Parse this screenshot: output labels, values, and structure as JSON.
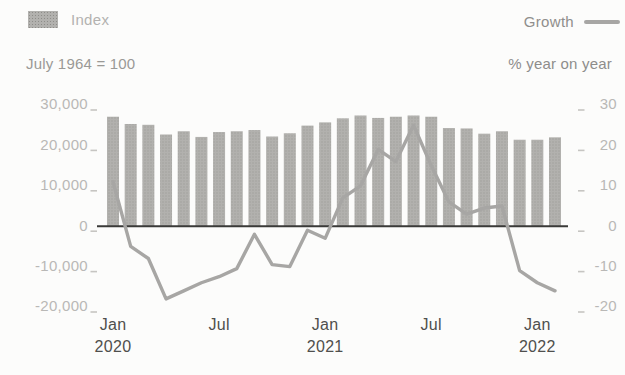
{
  "legend": {
    "index_label": "Index",
    "growth_label": "Growth"
  },
  "subtitles": {
    "left": "July 1964 = 100",
    "right": "% year on year"
  },
  "colors": {
    "page_bg": "#fcfcfb",
    "bar_base": "#b2b1ae",
    "bar_dot": "#8e8d89",
    "line": "#a7a6a4",
    "zero_axis": "#3a3a38",
    "tick_dash": "#c6c5c2",
    "ytick_text": "#b9b8b6",
    "xtick_text": "#4f4f4d",
    "legend_index_text": "#b3b2b0",
    "legend_growth_text": "#8f8e8c",
    "subtitle_left_text": "#9a9996",
    "subtitle_right_text": "#8e8d8b"
  },
  "chart_data": {
    "type": "combo",
    "subtypes": [
      "bar",
      "line"
    ],
    "categories": [
      "Jan 2020",
      "Feb 2020",
      "Mar 2020",
      "Apr 2020",
      "May 2020",
      "Jun 2020",
      "Jul 2020",
      "Aug 2020",
      "Sep 2020",
      "Oct 2020",
      "Nov 2020",
      "Dec 2020",
      "Jan 2021",
      "Feb 2021",
      "Mar 2021",
      "Apr 2021",
      "May 2021",
      "Jun 2021",
      "Jul 2021",
      "Aug 2021",
      "Sep 2021",
      "Oct 2021",
      "Nov 2021",
      "Dec 2021",
      "Jan 2022",
      "Feb 2022"
    ],
    "series": [
      {
        "name": "Index",
        "type": "bar",
        "axis": "left",
        "values": [
          27100,
          25300,
          25100,
          22700,
          23500,
          22100,
          23300,
          23500,
          23800,
          22200,
          23000,
          24900,
          25700,
          26700,
          27400,
          26800,
          27100,
          27400,
          27100,
          24300,
          24200,
          22900,
          23500,
          21400,
          21400,
          22000
        ]
      },
      {
        "name": "Growth",
        "type": "line",
        "axis": "right",
        "values": [
          11,
          -5,
          -8,
          -18,
          -16,
          -14,
          -12.5,
          -10.5,
          -2,
          -9.5,
          -10,
          -1,
          -3,
          7,
          10,
          19,
          16,
          25,
          15,
          6,
          3,
          4.5,
          5,
          -11,
          -14,
          -16
        ]
      }
    ],
    "left_axis": {
      "title": "July 1964 = 100",
      "range": [
        -20000,
        30000
      ],
      "ticks": [
        {
          "label": "30,000",
          "value": 30000
        },
        {
          "label": "20,000",
          "value": 20000
        },
        {
          "label": "10,000",
          "value": 10000
        },
        {
          "label": "0",
          "value": 0
        },
        {
          "label": "-10,000",
          "value": -10000
        },
        {
          "label": "-20,000",
          "value": -20000
        }
      ]
    },
    "right_axis": {
      "title": "% year on year",
      "range": [
        -20,
        30
      ],
      "ticks": [
        {
          "label": "30",
          "value": 30
        },
        {
          "label": "20",
          "value": 20
        },
        {
          "label": "10",
          "value": 10
        },
        {
          "label": "0",
          "value": 0
        },
        {
          "label": "-10",
          "value": -10
        },
        {
          "label": "-20",
          "value": -20
        }
      ]
    },
    "x_ticks": [
      {
        "index": 0,
        "top": "Jan",
        "bottom": "2020"
      },
      {
        "index": 6,
        "top": "Jul",
        "bottom": ""
      },
      {
        "index": 12,
        "top": "Jan",
        "bottom": "2021"
      },
      {
        "index": 18,
        "top": "Jul",
        "bottom": ""
      },
      {
        "index": 24,
        "top": "Jan",
        "bottom": "2022"
      }
    ],
    "legend_position": "top",
    "grid": false
  }
}
